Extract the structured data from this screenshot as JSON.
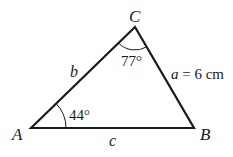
{
  "diagram": {
    "type": "triangle",
    "vertices": {
      "A": {
        "label": "A",
        "angle": "44°"
      },
      "B": {
        "label": "B"
      },
      "C": {
        "label": "C",
        "angle": "77°"
      }
    },
    "sides": {
      "a": {
        "label": "a = 6 cm",
        "name": "a",
        "value": "= 6 cm"
      },
      "b": {
        "label": "b"
      },
      "c": {
        "label": "c"
      }
    },
    "colors": {
      "line": "#1a1a1a",
      "background": "#ffffff"
    }
  }
}
